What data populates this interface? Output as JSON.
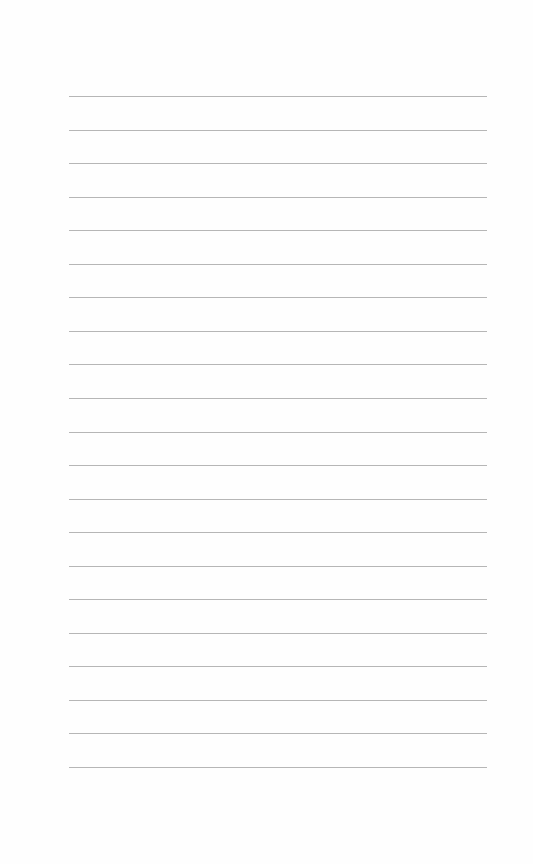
{
  "page": {
    "type": "lined-notebook-page",
    "background_color": "#fefefe",
    "line_color": "#a9a9a9",
    "line_count": 21,
    "first_line_y": 96,
    "line_spacing": 33.55,
    "line_left": 69,
    "line_width": 418
  }
}
